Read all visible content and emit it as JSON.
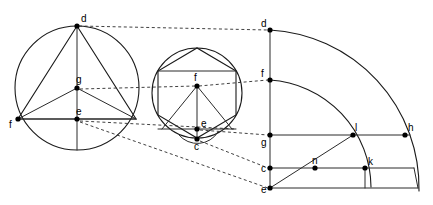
{
  "figure": {
    "background_color": "#ffffff",
    "line_color": "#1a1a1a",
    "dashed_line_color": "#2b2b2b",
    "point_color": "#000000"
  },
  "panels": [
    {
      "id": "left-circle",
      "name": "circle-with-inscribed-triangle",
      "circle": {
        "cx": 77,
        "cy": 88,
        "r": 62
      },
      "points": [
        {
          "id": "d",
          "label": "d",
          "x": 77,
          "y": 26,
          "label_dx": 4,
          "label_dy": -4
        },
        {
          "id": "g",
          "label": "g",
          "x": 77,
          "y": 88,
          "label_dx": -1,
          "label_dy": -5
        },
        {
          "id": "e",
          "label": "e",
          "x": 77,
          "y": 119,
          "label_dx": -1,
          "label_dy": -4
        },
        {
          "id": "f",
          "label": "f",
          "x": 18,
          "y": 119,
          "label_dx": -7,
          "label_dy": 9
        },
        {
          "id": "r",
          "label": "",
          "x": 136,
          "y": 119,
          "label_dx": 0,
          "label_dy": 0
        }
      ],
      "segments": [
        [
          "d",
          "f"
        ],
        [
          "d",
          "r"
        ],
        [
          "f",
          "r"
        ],
        [
          "g",
          "f"
        ],
        [
          "g",
          "r"
        ],
        [
          "d",
          "e"
        ],
        [
          "e",
          "bottom"
        ]
      ]
    },
    {
      "id": "middle-circle",
      "name": "circle-with-inscribed-hexagon",
      "circle": {
        "cx": 197,
        "cy": 93,
        "r": 45
      },
      "hexagon_rotation_deg": 0,
      "points": [
        {
          "id": "f",
          "label": "f",
          "x": 197,
          "y": 86,
          "label_dx": -1,
          "label_dy": -5
        },
        {
          "id": "e",
          "label": "e",
          "x": 197,
          "y": 129,
          "label_dx": 4,
          "label_dy": -2
        },
        {
          "id": "c",
          "label": "c",
          "x": 197,
          "y": 139,
          "label_dx": -1,
          "label_dy": 10
        }
      ]
    },
    {
      "id": "right-quadrant",
      "name": "concentric-arc-quadrant",
      "center": {
        "x": 270,
        "y": 188
      },
      "arcs": [
        {
          "id": "outer-arc",
          "radius": 158,
          "from_point": "d",
          "to_point": "arc-outer-end"
        },
        {
          "id": "inner-arc",
          "radius": 108,
          "from_point": "f",
          "to_point": "arc-inner-end"
        }
      ],
      "points": [
        {
          "id": "d",
          "label": "d",
          "x": 270,
          "y": 30,
          "label_dx": -9,
          "label_dy": -3
        },
        {
          "id": "f",
          "label": "f",
          "x": 270,
          "y": 80,
          "label_dx": -9,
          "label_dy": -3
        },
        {
          "id": "g",
          "label": "g",
          "x": 270,
          "y": 135,
          "label_dx": -9,
          "label_dy": 11
        },
        {
          "id": "c",
          "label": "c",
          "x": 270,
          "y": 168,
          "label_dx": -9,
          "label_dy": 4
        },
        {
          "id": "e",
          "label": "e",
          "x": 270,
          "y": 188,
          "label_dx": -9,
          "label_dy": 5
        },
        {
          "id": "l",
          "label": "l",
          "x": 353,
          "y": 135,
          "label_dx": 2,
          "label_dy": -4
        },
        {
          "id": "h",
          "label": "h",
          "x": 405,
          "y": 135,
          "label_dx": 3,
          "label_dy": -4
        },
        {
          "id": "k",
          "label": "k",
          "x": 365,
          "y": 168,
          "label_dx": 3,
          "label_dy": -3
        },
        {
          "id": "n",
          "label": "n",
          "x": 315,
          "y": 168,
          "label_dx": -2,
          "label_dy": -4
        }
      ],
      "horizontal_lines": [
        {
          "id": "line-g-h",
          "y": 135,
          "x1": 270,
          "x2": 410
        },
        {
          "id": "line-c-right",
          "y": 168,
          "x1": 270,
          "x2": 415
        },
        {
          "id": "line-e-right",
          "y": 188,
          "x1": 270,
          "x2": 419
        }
      ],
      "vertical_lines": [
        {
          "id": "axis-d-e",
          "x": 270,
          "y1": 30,
          "y2": 188
        },
        {
          "id": "tick-k",
          "x": 365,
          "y1": 168,
          "y2": 188
        }
      ],
      "radial_lines": [
        {
          "id": "radius-e-l",
          "from": "e",
          "to": "l"
        }
      ]
    }
  ],
  "connector_lines": [
    {
      "id": "conn-d-d",
      "style": "dashed",
      "from": "left d",
      "to": "right d",
      "x1": 79,
      "y1": 26,
      "x2": 268,
      "y2": 30
    },
    {
      "id": "conn-g-f",
      "style": "dashed",
      "from": "left g",
      "to": "middle f",
      "x1": 80,
      "y1": 89,
      "x2": 196,
      "y2": 86
    },
    {
      "id": "conn-mid-f-right-f",
      "style": "dashed",
      "from": "middle f",
      "to": "right f",
      "x1": 199,
      "y1": 86,
      "x2": 268,
      "y2": 80
    },
    {
      "id": "conn-e-e",
      "style": "dashed",
      "from": "left e",
      "to": "middle region",
      "x1": 80,
      "y1": 121,
      "x2": 240,
      "y2": 128
    },
    {
      "id": "conn-mid-e-right-g",
      "style": "dashed",
      "from": "middle e",
      "to": "right g",
      "x1": 200,
      "y1": 130,
      "x2": 268,
      "y2": 135
    },
    {
      "id": "conn-mid-c-right-c",
      "style": "dashed",
      "from": "middle c",
      "to": "right c",
      "x1": 200,
      "y1": 141,
      "x2": 268,
      "y2": 168
    },
    {
      "id": "conn-left-e-right-e",
      "style": "dashed",
      "from": "left e",
      "to": "right e",
      "x1": 80,
      "y1": 122,
      "x2": 268,
      "y2": 188
    }
  ],
  "labels": {
    "left": [
      "d",
      "g",
      "e",
      "f"
    ],
    "middle": [
      "f",
      "e",
      "c"
    ],
    "right": [
      "d",
      "f",
      "g",
      "c",
      "e",
      "l",
      "h",
      "k",
      "n"
    ]
  }
}
